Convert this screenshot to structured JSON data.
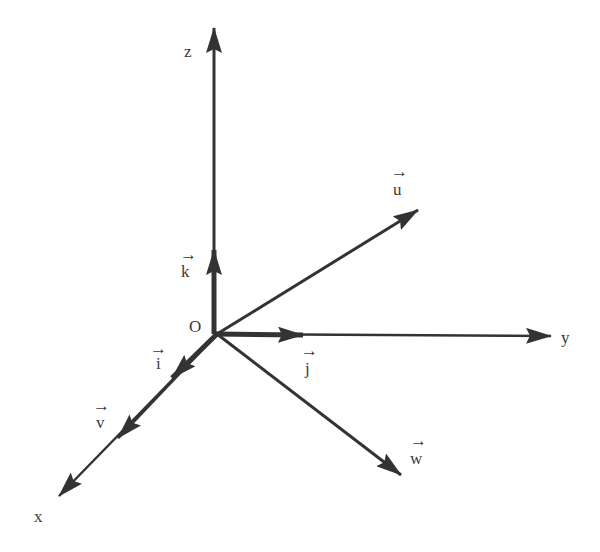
{
  "diagram": {
    "type": "3d-coordinate-axes-with-vectors",
    "colors": {
      "stroke": "#333333",
      "text": "#3a3a3a",
      "background": "#ffffff"
    },
    "origin": {
      "label": "O"
    },
    "axes": [
      {
        "id": "x",
        "label": "x"
      },
      {
        "id": "y",
        "label": "y"
      },
      {
        "id": "z",
        "label": "z"
      }
    ],
    "unit_vectors": [
      {
        "id": "i",
        "label": "i",
        "along": "x"
      },
      {
        "id": "j",
        "label": "j",
        "along": "y"
      },
      {
        "id": "k",
        "label": "k",
        "along": "z"
      }
    ],
    "vectors": [
      {
        "id": "u",
        "label": "u"
      },
      {
        "id": "v",
        "label": "v",
        "along": "x"
      },
      {
        "id": "w",
        "label": "w"
      }
    ],
    "vector_arrow_glyph": "→"
  }
}
